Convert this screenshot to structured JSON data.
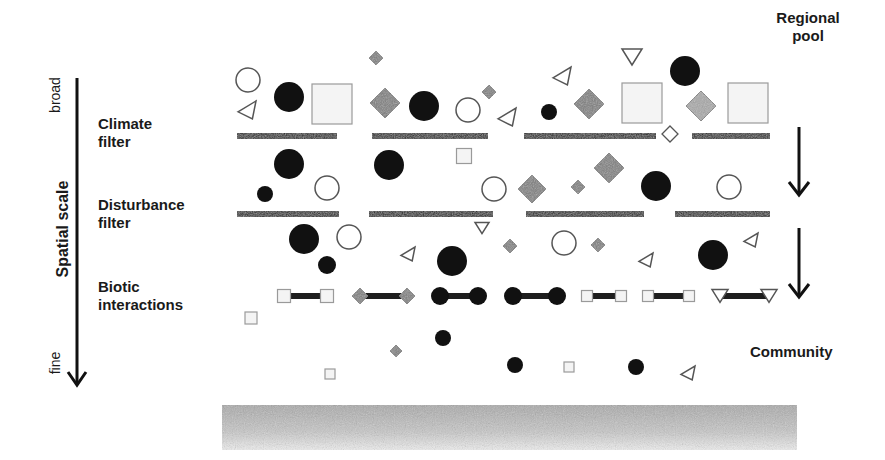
{
  "axis": {
    "title": "Spatial scale",
    "top_label": "broad",
    "bottom_label": "fine"
  },
  "filters": [
    {
      "line1": "Climate",
      "line2": "filter"
    },
    {
      "line1": "Disturbance",
      "line2": "filter"
    },
    {
      "line1": "Biotic",
      "line2": "interactions"
    }
  ],
  "right_labels": {
    "top": {
      "line1": "Regional",
      "line2": "pool"
    },
    "bottom": "Community"
  },
  "colors": {
    "black": "#111111",
    "diamond_gray": "#7d7d7d",
    "diamond_light": "#a8a8a8",
    "square_fill": "#f4f4f4",
    "outline": "#555555",
    "ground": "#bdbdbd"
  },
  "filter_bars": [
    {
      "y": 133,
      "segments": [
        [
          237,
          337
        ],
        [
          372,
          488
        ],
        [
          524,
          656
        ],
        [
          692,
          770
        ]
      ]
    },
    {
      "y": 211,
      "segments": [
        [
          237,
          339
        ],
        [
          369,
          493
        ],
        [
          526,
          644
        ],
        [
          675,
          770
        ]
      ]
    }
  ],
  "shapes": [
    {
      "t": "ocircle",
      "x": 248,
      "y": 80,
      "r": 12
    },
    {
      "t": "circle",
      "x": 289,
      "y": 97,
      "r": 15
    },
    {
      "t": "square",
      "x": 332,
      "y": 104,
      "s": 40
    },
    {
      "t": "tri-left",
      "x": 247,
      "y": 110,
      "s": 18
    },
    {
      "t": "diamond",
      "x": 376,
      "y": 58,
      "s": 7,
      "c": "dark"
    },
    {
      "t": "diamond",
      "x": 385,
      "y": 103,
      "s": 15
    },
    {
      "t": "circle",
      "x": 424,
      "y": 106,
      "r": 15
    },
    {
      "t": "ocircle",
      "x": 468,
      "y": 110,
      "r": 12
    },
    {
      "t": "diamond",
      "x": 489,
      "y": 92,
      "s": 7
    },
    {
      "t": "tri-left",
      "x": 507,
      "y": 117,
      "s": 18
    },
    {
      "t": "tri-left",
      "x": 562,
      "y": 76,
      "s": 18
    },
    {
      "t": "tri-down",
      "x": 632,
      "y": 57,
      "s": 20
    },
    {
      "t": "circle",
      "x": 685,
      "y": 71,
      "r": 15
    },
    {
      "t": "circle",
      "x": 549,
      "y": 112,
      "r": 8
    },
    {
      "t": "diamond",
      "x": 589,
      "y": 104,
      "s": 15
    },
    {
      "t": "square",
      "x": 642,
      "y": 103,
      "s": 40
    },
    {
      "t": "diamond",
      "x": 701,
      "y": 106,
      "s": 15,
      "c": "light"
    },
    {
      "t": "square",
      "x": 748,
      "y": 103,
      "s": 40
    },
    {
      "t": "odiamond",
      "x": 670,
      "y": 134,
      "s": 8
    },
    {
      "t": "circle",
      "x": 289,
      "y": 164,
      "r": 15
    },
    {
      "t": "circle",
      "x": 265,
      "y": 194,
      "r": 8
    },
    {
      "t": "ocircle",
      "x": 327,
      "y": 188,
      "r": 12
    },
    {
      "t": "circle",
      "x": 389,
      "y": 165,
      "r": 15
    },
    {
      "t": "square",
      "x": 464,
      "y": 156,
      "s": 15
    },
    {
      "t": "ocircle",
      "x": 494,
      "y": 189,
      "r": 12
    },
    {
      "t": "diamond",
      "x": 532,
      "y": 189,
      "s": 14,
      "c": "dark"
    },
    {
      "t": "diamond",
      "x": 578,
      "y": 187,
      "s": 7,
      "c": "dark"
    },
    {
      "t": "diamond",
      "x": 609,
      "y": 168,
      "s": 15,
      "c": "dark"
    },
    {
      "t": "circle",
      "x": 656,
      "y": 186,
      "r": 15
    },
    {
      "t": "ocircle",
      "x": 729,
      "y": 187,
      "r": 12
    },
    {
      "t": "circle",
      "x": 304,
      "y": 239,
      "r": 15
    },
    {
      "t": "ocircle",
      "x": 349,
      "y": 237,
      "r": 12
    },
    {
      "t": "circle",
      "x": 327,
      "y": 265,
      "r": 9
    },
    {
      "t": "tri-left",
      "x": 408,
      "y": 254,
      "s": 14
    },
    {
      "t": "tri-down",
      "x": 482,
      "y": 228,
      "s": 14
    },
    {
      "t": "circle",
      "x": 452,
      "y": 261,
      "r": 15
    },
    {
      "t": "diamond",
      "x": 510,
      "y": 246,
      "s": 7,
      "c": "dark"
    },
    {
      "t": "ocircle",
      "x": 564,
      "y": 243,
      "r": 12
    },
    {
      "t": "diamond",
      "x": 598,
      "y": 245,
      "s": 7,
      "c": "dark"
    },
    {
      "t": "tri-left",
      "x": 646,
      "y": 260,
      "s": 14
    },
    {
      "t": "circle",
      "x": 713,
      "y": 255,
      "r": 15
    },
    {
      "t": "tri-left",
      "x": 751,
      "y": 240,
      "s": 14
    },
    {
      "t": "square",
      "x": 251,
      "y": 318,
      "s": 12
    },
    {
      "t": "diamond",
      "x": 396,
      "y": 351,
      "s": 6,
      "c": "dark"
    },
    {
      "t": "circle",
      "x": 443,
      "y": 338,
      "r": 8
    },
    {
      "t": "square",
      "x": 330,
      "y": 374,
      "s": 10
    },
    {
      "t": "circle",
      "x": 515,
      "y": 365,
      "r": 8
    },
    {
      "t": "square",
      "x": 569,
      "y": 367,
      "s": 10
    },
    {
      "t": "circle",
      "x": 636,
      "y": 367,
      "r": 8
    },
    {
      "t": "tri-left",
      "x": 688,
      "y": 373,
      "s": 14
    }
  ],
  "pairs": [
    {
      "t": "square",
      "x1": 284,
      "x2": 327,
      "y": 296,
      "s": 13
    },
    {
      "t": "diamond",
      "x1": 360,
      "x2": 407,
      "y": 296,
      "s": 8
    },
    {
      "t": "circle",
      "x1": 440,
      "x2": 478,
      "y": 296,
      "s": 9
    },
    {
      "t": "circle",
      "x1": 513,
      "x2": 557,
      "y": 296,
      "s": 9
    },
    {
      "t": "square",
      "x1": 587,
      "x2": 621,
      "y": 296,
      "s": 11
    },
    {
      "t": "square",
      "x1": 648,
      "x2": 689,
      "y": 296,
      "s": 11
    },
    {
      "t": "tri-down",
      "x1": 720,
      "x2": 769,
      "y": 296,
      "s": 16
    }
  ],
  "flow_arrows": [
    {
      "x": 799,
      "y1": 127,
      "y2": 195
    },
    {
      "x": 799,
      "y1": 228,
      "y2": 297
    }
  ]
}
